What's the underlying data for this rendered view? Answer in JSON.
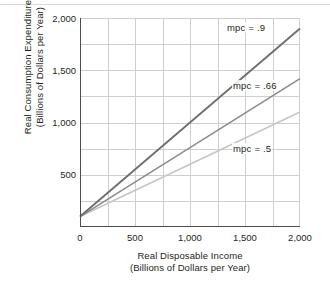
{
  "chart_data": {
    "type": "line",
    "title": "",
    "xlabel": "Real Disposable Income",
    "xlabel_sub": "(Billions of Dollars per Year)",
    "ylabel": "Real Consumption Expenditure",
    "ylabel_sub": "(Billions of Dollars per Year)",
    "xlim": [
      0,
      2000
    ],
    "ylim": [
      0,
      2000
    ],
    "xticks": [
      "0",
      "500",
      "1,000",
      "1,500",
      "2,000"
    ],
    "xtick_values": [
      0,
      500,
      1000,
      1500,
      2000
    ],
    "yticks": [
      "500",
      "1,000",
      "1,500",
      "2,000"
    ],
    "ytick_values": [
      500,
      1000,
      1500,
      2000
    ],
    "grid": true,
    "grid_color": "#cfcfcf",
    "legend_position": "inline-annotations",
    "series": [
      {
        "name": "mpc = .9",
        "label": "mpc = .9",
        "slope": 0.9,
        "intercept": 100,
        "color": "#6d6d6d",
        "x": [
          0,
          2000
        ],
        "values": [
          100,
          1900
        ]
      },
      {
        "name": "mpc = .66",
        "label": "mpc = .66",
        "slope": 0.66,
        "intercept": 100,
        "color": "#8a8a8a",
        "x": [
          0,
          2000
        ],
        "values": [
          100,
          1420
        ]
      },
      {
        "name": "mpc = .5",
        "label": "mpc = .5",
        "slope": 0.5,
        "intercept": 100,
        "color": "#c6c6c6",
        "x": [
          0,
          2000
        ],
        "values": [
          100,
          1100
        ]
      }
    ],
    "annotations": [
      {
        "text": "mpc = .9",
        "x": 1500,
        "y": 1960
      },
      {
        "text": "mpc = .66",
        "x": 1560,
        "y": 1395
      },
      {
        "text": "mpc = .5",
        "x": 1560,
        "y": 790
      }
    ]
  },
  "axes": {
    "y": {
      "title_line1": "Real Consumption Expenditure",
      "title_line2": "(Billions of Dollars per Year)",
      "tick_2000": "2,000",
      "tick_1500": "1,500",
      "tick_1000": "1,000",
      "tick_500": "500"
    },
    "x": {
      "title_line1": "Real Disposable Income",
      "title_line2": "(Billions of Dollars per Year)",
      "tick_0": "0",
      "tick_500": "500",
      "tick_1000": "1,000",
      "tick_1500": "1,500",
      "tick_2000": "2,000"
    }
  },
  "annotations": {
    "mpc_high": "mpc = .9",
    "mpc_mid": "mpc = .66",
    "mpc_low": "mpc = .5"
  }
}
